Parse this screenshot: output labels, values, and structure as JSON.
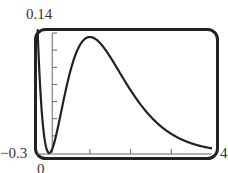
{
  "chart_data": {
    "type": "line",
    "title": "",
    "xlabel": "",
    "ylabel": "",
    "function": "x^2 * e^(-2x)",
    "xlim": [
      -0.3,
      4
    ],
    "ylim": [
      0,
      0.14
    ],
    "window_labels": {
      "x_min": "−0.3",
      "x_max": "4",
      "y_min": "0",
      "y_max": "0.14"
    },
    "x_ticks": [
      1,
      2,
      3
    ],
    "y_ticks": [
      0.02,
      0.04,
      0.06,
      0.08,
      0.1,
      0.12,
      0.14
    ],
    "grid": false,
    "series": [
      {
        "name": "f(x)",
        "x": [
          -0.3,
          -0.2,
          -0.1,
          0,
          0.25,
          0.5,
          0.75,
          1,
          1.25,
          1.5,
          2,
          2.5,
          3,
          3.5,
          4
        ],
        "y": [
          0.164,
          0.06,
          0.012,
          0,
          0.038,
          0.092,
          0.126,
          0.135,
          0.128,
          0.112,
          0.073,
          0.042,
          0.022,
          0.011,
          0.005
        ]
      }
    ],
    "color": "#222222"
  }
}
